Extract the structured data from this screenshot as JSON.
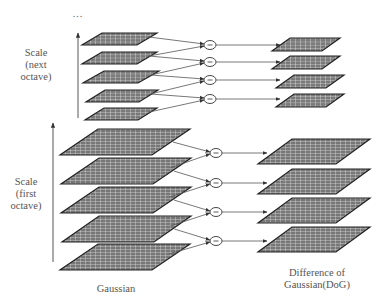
{
  "figure": {
    "ellipsis": "...",
    "labels": {
      "next_octave": [
        "Scale",
        "(next",
        "octave)"
      ],
      "first_octave": [
        "Scale",
        "(first",
        "octave)"
      ],
      "gaussian": "Gaussian",
      "dog": [
        "Difference of",
        "Gaussian(DoG)"
      ]
    },
    "operator_symbol": "−",
    "colors": {
      "grid_fill": "#7a7a7a",
      "grid_line": "#e8e8e8",
      "edge": "#222222",
      "arrow": "#555555",
      "text": "#555555"
    },
    "octaves": [
      {
        "name": "next octave",
        "gaussian_layers": 5,
        "dog_layers": 4,
        "gaussian_y": [
          38,
          57,
          76,
          95,
          113
        ],
        "operator_y": [
          45,
          62,
          80,
          99
        ],
        "operator_x": 210,
        "dog_y": [
          45,
          63,
          82,
          101
        ]
      },
      {
        "name": "first octave",
        "gaussian_layers": 5,
        "dog_layers": 4,
        "gaussian_y": [
          143,
          172,
          201,
          230,
          258
        ],
        "operator_y": [
          153,
          183,
          212,
          241
        ],
        "operator_x": 216,
        "dog_y": [
          153,
          183,
          212,
          241
        ]
      }
    ]
  }
}
